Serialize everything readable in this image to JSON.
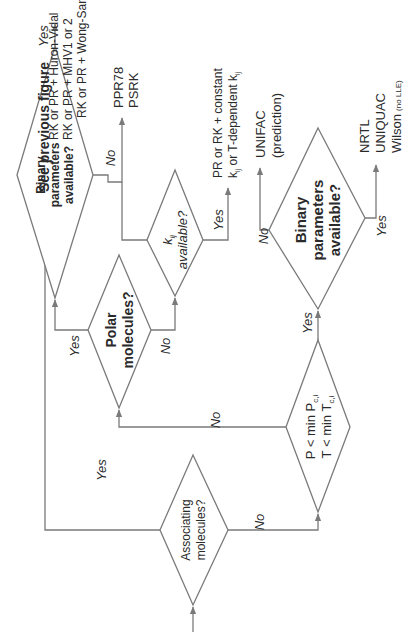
{
  "figure": {
    "orientation": "rotated 90 degrees counter-clockwise",
    "line_color": "#7a7a7a",
    "text_color": "#2a2a2a",
    "background": "#ffffff"
  },
  "nodes": {
    "associating": {
      "line1": "Associating",
      "line2": "molecules?"
    },
    "see_previous": {
      "text": "See previous figure"
    },
    "pressure_temp": {
      "line1": "P < min P",
      "sub1": "c,i",
      "line2": "T < min T",
      "sub2": "c,i"
    },
    "polar": {
      "line1": "Polar",
      "line2": "molecules?"
    },
    "binary1": {
      "line1": "Binary",
      "line2": "parameters",
      "line3": "available?"
    },
    "kij": {
      "line1": "k",
      "sub1": "ij",
      "line2": "available?"
    },
    "binary2": {
      "line1": "Binary",
      "line2": "parameters",
      "line3": "available?"
    }
  },
  "outcomes": {
    "gE_mixing": [
      "RK or PR + Huron-Vidal",
      "RK or PR + MHV1 or 2",
      "RK or PR + Wong-Sandler"
    ],
    "predictive_eos": [
      "PPR78",
      "PSRK"
    ],
    "cubic_kij": {
      "line1": "PR  or  RK + constant",
      "line2_a": "k",
      "line2_sub_a": "ij",
      "line2_b": " or T-dependent k",
      "line2_sub_b": "ij"
    },
    "unifac": [
      "UNIFAC",
      "(prediction)"
    ],
    "activity_models": {
      "line1": "NRTL",
      "line2": "UNIQUAC",
      "line3": "Wilson",
      "line3_note": "(no LLE)"
    }
  },
  "edge_labels": {
    "assoc_yes": "Yes",
    "assoc_no": "No",
    "pt_no": "No",
    "pt_yes": "Yes",
    "polar_yes": "Yes",
    "polar_no": "No",
    "binary1_yes": "Yes",
    "binary1_no": "No",
    "kij_yes": "Yes",
    "binary2_no": "No",
    "binary2_yes": "Yes"
  }
}
